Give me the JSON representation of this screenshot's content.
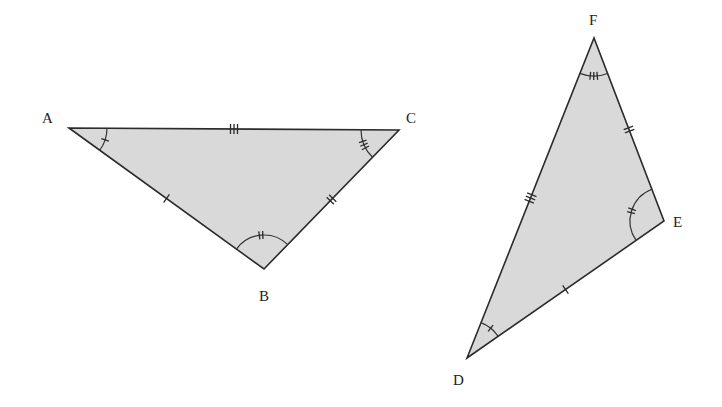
{
  "diagram": {
    "fill_color": "#d9d9d9",
    "stroke_color": "#2b2b2b",
    "triangles": [
      {
        "name": "ABC",
        "vertices": {
          "A": {
            "label": "A",
            "x": 69,
            "y": 128,
            "lx": 42,
            "ly": 123
          },
          "B": {
            "label": "B",
            "x": 264,
            "y": 269,
            "lx": 259,
            "ly": 301
          },
          "C": {
            "label": "C",
            "x": 399,
            "y": 130,
            "lx": 406,
            "ly": 123
          }
        },
        "side_marks": {
          "AB": 1,
          "BC": 2,
          "CA": 3
        },
        "angle_marks": {
          "A": 1,
          "B": 2,
          "C": 3
        }
      },
      {
        "name": "DEF",
        "vertices": {
          "D": {
            "label": "D",
            "x": 467,
            "y": 358,
            "lx": 453,
            "ly": 385
          },
          "E": {
            "label": "E",
            "x": 664,
            "y": 221,
            "lx": 673,
            "ly": 227
          },
          "F": {
            "label": "F",
            "x": 594,
            "y": 38,
            "lx": 589,
            "ly": 25
          }
        },
        "side_marks": {
          "DE": 1,
          "EF": 2,
          "FD": 3
        },
        "angle_marks": {
          "D": 1,
          "E": 2,
          "F": 3
        }
      }
    ]
  }
}
